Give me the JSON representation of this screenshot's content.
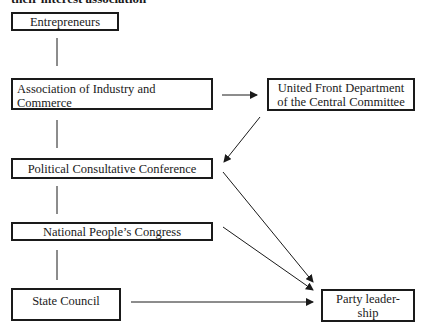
{
  "caption": "their interest association",
  "nodes": {
    "entrepreneurs": "Entrepreneurs",
    "association": "Association of Industry and Commerce",
    "united_front": "United Front Department of the Central Committee",
    "cppcc": "Political Consultative Conference",
    "npc": "National People’s Congress",
    "state_council": "State Council",
    "party": "Party leader-ship"
  },
  "node_lines": {
    "association": [
      "Association of Industry and",
      "Commerce"
    ],
    "united_front": [
      "United Front Department",
      "of the Central Committee"
    ],
    "party": [
      "Party leader-",
      "ship"
    ]
  },
  "edges": [
    {
      "from": "entrepreneurs",
      "to": "association",
      "type": "line"
    },
    {
      "from": "association",
      "to": "cppcc",
      "type": "line"
    },
    {
      "from": "cppcc",
      "to": "npc",
      "type": "line"
    },
    {
      "from": "npc",
      "to": "state_council",
      "type": "line"
    },
    {
      "from": "association",
      "to": "united_front",
      "type": "arrow"
    },
    {
      "from": "united_front",
      "to": "cppcc",
      "type": "arrow"
    },
    {
      "from": "cppcc",
      "to": "party",
      "type": "arrow"
    },
    {
      "from": "npc",
      "to": "party",
      "type": "arrow"
    },
    {
      "from": "state_council",
      "to": "party",
      "type": "arrow"
    }
  ]
}
